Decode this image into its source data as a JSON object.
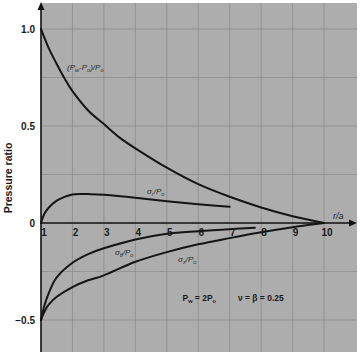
{
  "chart_data": {
    "type": "line",
    "title": "",
    "xlabel": "r/a",
    "ylabel": "Pressure ratio",
    "xlim": [
      1,
      11
    ],
    "ylim": [
      -0.66,
      1.13
    ],
    "grid": true,
    "grid_x_step": 1,
    "grid_y_step": 0.25,
    "legend": "inline labels on curves",
    "xticks": [
      {
        "value": 1,
        "label": "1"
      },
      {
        "value": 2,
        "label": "2"
      },
      {
        "value": 3,
        "label": "3"
      },
      {
        "value": 4,
        "label": "4"
      },
      {
        "value": 5,
        "label": "5"
      },
      {
        "value": 6,
        "label": "6"
      },
      {
        "value": 7,
        "label": "7"
      },
      {
        "value": 8,
        "label": "8"
      },
      {
        "value": 9,
        "label": "9"
      },
      {
        "value": 10,
        "label": "10"
      }
    ],
    "yticks": [
      {
        "value": 1.0,
        "label": "1.0"
      },
      {
        "value": 0.5,
        "label": "0.5"
      },
      {
        "value": 0,
        "label": "0"
      },
      {
        "value": -0.5,
        "label": "−0.5"
      }
    ],
    "series": [
      {
        "name": "(Pw-Po)/Po",
        "x": [
          1,
          1.25,
          1.5,
          1.75,
          2,
          2.5,
          3,
          3.5,
          4,
          5,
          6,
          7,
          8,
          9,
          10
        ],
        "y": [
          1.0,
          0.9,
          0.82,
          0.745,
          0.68,
          0.58,
          0.51,
          0.44,
          0.385,
          0.285,
          0.2,
          0.135,
          0.08,
          0.035,
          0.0
        ]
      },
      {
        "name": "σr/Po",
        "x": [
          1,
          1.1,
          1.25,
          1.5,
          1.75,
          2,
          2.25,
          2.5,
          3,
          4,
          5,
          6,
          7
        ],
        "y": [
          0,
          0.045,
          0.08,
          0.115,
          0.135,
          0.147,
          0.15,
          0.149,
          0.145,
          0.13,
          0.112,
          0.097,
          0.084
        ]
      },
      {
        "name": "σθ/Po",
        "x": [
          1,
          1.1,
          1.25,
          1.5,
          2,
          2.5,
          3,
          4,
          5,
          6,
          7,
          7.8
        ],
        "y": [
          -0.5,
          -0.43,
          -0.36,
          -0.28,
          -0.205,
          -0.16,
          -0.13,
          -0.085,
          -0.055,
          -0.042,
          -0.032,
          -0.025
        ]
      },
      {
        "name": "σz/Po",
        "x": [
          1,
          1.1,
          1.25,
          1.5,
          2,
          2.5,
          3,
          4,
          5,
          6,
          7,
          8,
          9,
          10
        ],
        "y": [
          -0.5,
          -0.46,
          -0.42,
          -0.38,
          -0.33,
          -0.295,
          -0.27,
          -0.2,
          -0.15,
          -0.11,
          -0.078,
          -0.048,
          -0.022,
          0.0
        ]
      }
    ],
    "annotations": [
      {
        "name": "label-pressure-curve",
        "x": 1.83,
        "y": 0.79,
        "style": "annot",
        "parts": [
          {
            "t": "(P"
          },
          {
            "t": "w",
            "sub": true
          },
          {
            "t": "-P"
          },
          {
            "t": "o",
            "sub": true
          },
          {
            "t": ")/P"
          },
          {
            "t": "o",
            "sub": true
          }
        ]
      },
      {
        "name": "label-sigma-r",
        "x": 4.37,
        "y": 0.15,
        "style": "annot",
        "parts": [
          {
            "t": "σ"
          },
          {
            "t": "r",
            "sub": true
          },
          {
            "t": "/P"
          },
          {
            "t": "o",
            "sub": true
          }
        ]
      },
      {
        "name": "label-sigma-theta",
        "x": 3.35,
        "y": -0.165,
        "style": "annot",
        "parts": [
          {
            "t": "σ"
          },
          {
            "t": "θ",
            "sub": true
          },
          {
            "t": "/P"
          },
          {
            "t": "o",
            "sub": true
          }
        ]
      },
      {
        "name": "label-sigma-z",
        "x": 5.36,
        "y": -0.2,
        "style": "annot",
        "parts": [
          {
            "t": "σ"
          },
          {
            "t": "z",
            "sub": true
          },
          {
            "t": "/P"
          },
          {
            "t": "o",
            "sub": true
          }
        ]
      },
      {
        "name": "label-boundary-condition",
        "x": 5.5,
        "y": -0.4,
        "style": "annot-bold",
        "parts": [
          {
            "t": "P"
          },
          {
            "t": "w",
            "sub": true
          },
          {
            "t": " = 2P"
          },
          {
            "t": "o",
            "sub": true
          }
        ]
      },
      {
        "name": "label-parameters",
        "x": 7.26,
        "y": -0.4,
        "style": "annot-bold",
        "parts": [
          {
            "t": "ν = β = 0.25"
          }
        ]
      }
    ]
  },
  "colors": {
    "plot_background": "#adadad",
    "grid": "#8e8e8e",
    "curve": "#151515",
    "page_background": "#ffffff"
  }
}
